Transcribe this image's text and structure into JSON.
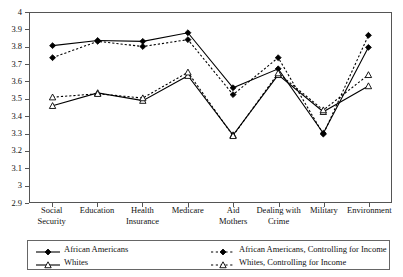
{
  "chart_data": {
    "type": "line",
    "title": "",
    "subtitle": "",
    "xlabel": "",
    "ylabel": "",
    "ylim": [
      2.9,
      4
    ],
    "grid": false,
    "legend_position": "bottom",
    "categories": [
      "Social Security",
      "Education",
      "Health Insurance",
      "Medicare",
      "Aid Mothers",
      "Dealing with Crime",
      "Military",
      "Environment"
    ],
    "category_lines": [
      [
        "Social",
        "Security"
      ],
      [
        "Education",
        ""
      ],
      [
        "Health",
        "Insurance"
      ],
      [
        "Medicare",
        ""
      ],
      [
        "Aid",
        "Mothers"
      ],
      [
        "Dealing with",
        "Crime"
      ],
      [
        "Military",
        ""
      ],
      [
        "Environment",
        ""
      ]
    ],
    "ytick_labels": [
      "4",
      "3.9",
      "3.8",
      "3.7",
      "3.6",
      "3.5",
      "3.4",
      "3.3",
      "3.2",
      "3.1",
      "3",
      "2.9"
    ],
    "ytick_values": [
      4,
      3.9,
      3.8,
      3.7,
      3.6,
      3.5,
      3.4,
      3.3,
      3.2,
      3.1,
      3.0,
      2.9
    ],
    "series": [
      {
        "name": "African Americans",
        "style": "solid",
        "marker": "filled-diamond",
        "color": "#000000",
        "values": [
          3.81,
          3.84,
          3.835,
          3.885,
          3.565,
          3.675,
          3.3,
          3.8
        ]
      },
      {
        "name": "African Americans, Controlling for Income",
        "style": "dotted",
        "marker": "filled-diamond",
        "color": "#000000",
        "values": [
          3.74,
          3.835,
          3.805,
          3.845,
          3.525,
          3.74,
          3.295,
          3.87
        ]
      },
      {
        "name": "Whites",
        "style": "solid",
        "marker": "open-triangle",
        "color": "#000000",
        "values": [
          3.46,
          3.535,
          3.49,
          3.635,
          3.29,
          3.64,
          3.425,
          3.575
        ]
      },
      {
        "name": "Whites, Controlling for Income",
        "style": "dotted",
        "marker": "open-triangle",
        "color": "#000000",
        "values": [
          3.51,
          3.53,
          3.505,
          3.655,
          3.285,
          3.65,
          3.435,
          3.64
        ]
      }
    ]
  },
  "legend": {
    "entries": [
      {
        "label": "African Americans",
        "style": "solid",
        "marker": "filled-diamond"
      },
      {
        "label": "Whites",
        "style": "solid",
        "marker": "open-triangle"
      },
      {
        "label": "African Americans, Controlling for Income",
        "style": "dotted",
        "marker": "filled-diamond"
      },
      {
        "label": "Whites, Controlling for Income",
        "style": "dotted",
        "marker": "open-triangle"
      }
    ]
  }
}
